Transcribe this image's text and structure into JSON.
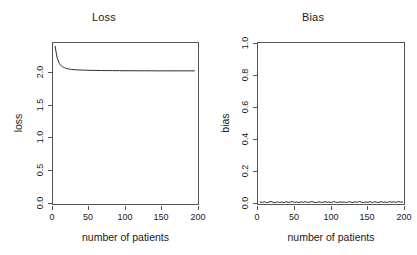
{
  "figure": {
    "background": "#ffffff",
    "axis_color": "#555555",
    "text_color": "#1a1a1a",
    "line_color": "#2b2b2b"
  },
  "panels": [
    {
      "key": "loss",
      "title": "Loss",
      "xlabel": "number of patients",
      "ylabel": "loss",
      "x_ticks": [
        "0",
        "50",
        "100",
        "150",
        "200"
      ],
      "y_ticks": [
        "0.0",
        "0.5",
        "1.0",
        "1.5",
        "2.0"
      ]
    },
    {
      "key": "bias",
      "title": "Bias",
      "xlabel": "number of patients",
      "ylabel": "bias",
      "x_ticks": [
        "0",
        "50",
        "100",
        "150",
        "200"
      ],
      "y_ticks": [
        "0.0",
        "0.2",
        "0.4",
        "0.6",
        "0.8",
        "1.0"
      ]
    }
  ],
  "chart_data": [
    {
      "type": "line",
      "title": "Loss",
      "xlabel": "number of patients",
      "ylabel": "loss",
      "xlim": [
        2,
        205
      ],
      "ylim": [
        0.0,
        2.45
      ],
      "xticks": [
        0,
        50,
        100,
        150,
        200
      ],
      "yticks": [
        0.0,
        0.5,
        1.0,
        1.5,
        2.0
      ],
      "grid": false,
      "legend": null,
      "series": [
        {
          "name": "loss",
          "x": [
            5,
            6,
            7,
            8,
            9,
            10,
            11,
            12,
            13,
            14,
            15,
            16,
            17,
            18,
            19,
            20,
            22,
            24,
            26,
            28,
            30,
            33,
            36,
            40,
            45,
            50,
            55,
            60,
            65,
            70,
            75,
            80,
            85,
            90,
            95,
            100,
            110,
            120,
            130,
            140,
            150,
            160,
            170,
            180,
            190,
            200
          ],
          "y": [
            2.4,
            2.33,
            2.27,
            2.22,
            2.19,
            2.16,
            2.14,
            2.12,
            2.11,
            2.1,
            2.09,
            2.085,
            2.08,
            2.075,
            2.07,
            2.065,
            2.06,
            2.055,
            2.05,
            2.048,
            2.046,
            2.043,
            2.041,
            2.039,
            2.037,
            2.035,
            2.034,
            2.033,
            2.032,
            2.031,
            2.031,
            2.03,
            2.03,
            2.029,
            2.029,
            2.028,
            2.028,
            2.027,
            2.027,
            2.027,
            2.026,
            2.026,
            2.026,
            2.026,
            2.026,
            2.026
          ]
        }
      ]
    },
    {
      "type": "line",
      "title": "Bias",
      "xlabel": "number of patients",
      "ylabel": "bias",
      "xlim": [
        2,
        205
      ],
      "ylim": [
        0.0,
        1.04
      ],
      "xticks": [
        0,
        50,
        100,
        150,
        200
      ],
      "yticks": [
        0.0,
        0.2,
        0.4,
        0.6,
        0.8,
        1.0
      ],
      "grid": false,
      "legend": null,
      "series": [
        {
          "name": "bias",
          "x": [
            5,
            8,
            11,
            14,
            17,
            20,
            23,
            26,
            29,
            32,
            35,
            38,
            41,
            44,
            47,
            50,
            53,
            56,
            59,
            62,
            65,
            68,
            71,
            74,
            77,
            80,
            83,
            86,
            89,
            92,
            95,
            98,
            101,
            104,
            107,
            110,
            113,
            116,
            119,
            122,
            125,
            128,
            131,
            134,
            137,
            140,
            143,
            146,
            149,
            152,
            155,
            158,
            161,
            164,
            167,
            170,
            173,
            176,
            179,
            182,
            185,
            188,
            191,
            194,
            197,
            200,
            203
          ],
          "y": [
            0.013,
            0.01,
            0.015,
            0.009,
            0.012,
            0.016,
            0.011,
            0.008,
            0.014,
            0.01,
            0.013,
            0.009,
            0.015,
            0.011,
            0.012,
            0.016,
            0.01,
            0.013,
            0.009,
            0.014,
            0.011,
            0.015,
            0.01,
            0.012,
            0.016,
            0.011,
            0.009,
            0.014,
            0.012,
            0.01,
            0.015,
            0.011,
            0.013,
            0.009,
            0.016,
            0.012,
            0.01,
            0.014,
            0.011,
            0.013,
            0.009,
            0.015,
            0.012,
            0.01,
            0.014,
            0.011,
            0.016,
            0.012,
            0.009,
            0.013,
            0.011,
            0.015,
            0.01,
            0.014,
            0.012,
            0.009,
            0.016,
            0.011,
            0.013,
            0.01,
            0.015,
            0.012,
            0.014,
            0.011,
            0.016,
            0.013,
            0.012
          ]
        }
      ]
    }
  ]
}
